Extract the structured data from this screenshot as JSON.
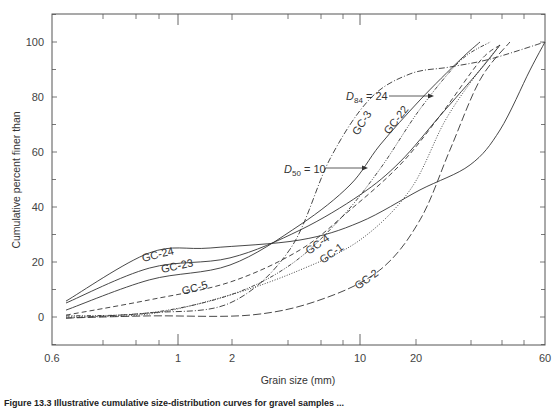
{
  "chart_data": {
    "type": "line",
    "title": "",
    "xlabel": "Grain size (mm)",
    "ylabel": "Cumulative percent finer than",
    "xscale": "log",
    "xlim": [
      0.6,
      60
    ],
    "ylim": [
      -10,
      110
    ],
    "grid": false,
    "legend": "inline curve labels",
    "x_tick_labels": [
      "0.6",
      "1",
      "2",
      "10",
      "20",
      "60"
    ],
    "y_tick_labels": [
      "0",
      "20",
      "40",
      "60",
      "80",
      "100"
    ],
    "series": [
      {
        "name": "GC-24",
        "style": "solid",
        "x": [
          0.635,
          0.89,
          1.51,
          4.7,
          10,
          20.7,
          31.7,
          40.9,
          52.8,
          60
        ],
        "y": [
          5.8,
          23.3,
          25.1,
          28.0,
          34.5,
          46.2,
          55.3,
          68.0,
          89.8,
          100
        ]
      },
      {
        "name": "GC-23",
        "style": "solid",
        "x": [
          0.635,
          0.89,
          1.95,
          4.7,
          10,
          16.4,
          24.5,
          34.5,
          40.9
        ],
        "y": [
          5.1,
          17.8,
          21.5,
          31.6,
          44.4,
          56.4,
          73.1,
          89.8,
          98.9
        ]
      },
      {
        "name": "GC-22",
        "style": "solid",
        "x": [
          0.635,
          0.89,
          1.95,
          4.7,
          8.82,
          12.8,
          20.7,
          29.1,
          34.5
        ],
        "y": [
          2.5,
          13.5,
          18.9,
          33.5,
          48.0,
          62.5,
          78.9,
          93.5,
          100
        ]
      },
      {
        "name": "GC-3",
        "style": "dash-dot",
        "x": [
          0.635,
          0.89,
          1.95,
          4.15,
          6.86,
          11.3,
          18.6,
          26.7,
          37.6,
          60
        ],
        "y": [
          -0.4,
          1.5,
          5.1,
          24.7,
          57.5,
          79.3,
          88.4,
          90.9,
          93.8,
          100
        ]
      },
      {
        "name": "GC-5",
        "style": "dashed",
        "x": [
          0.635,
          0.89,
          1.95,
          4.7,
          8.82,
          16.4,
          24.5,
          34.5,
          40.9
        ],
        "y": [
          0.7,
          6.2,
          12.7,
          24.4,
          38.9,
          55.3,
          73.1,
          93.1,
          98.9
        ]
      },
      {
        "name": "GC-4",
        "style": "dash-dot-dot",
        "x": [
          0.635,
          0.89,
          1.95,
          4.15,
          7.78,
          12.8,
          20.7,
          29.1,
          37.6
        ],
        "y": [
          0.4,
          1.5,
          8.0,
          18.9,
          35.6,
          53.8,
          75.6,
          93.1,
          100
        ]
      },
      {
        "name": "GC-1",
        "style": "dotted",
        "x": [
          0.635,
          0.89,
          1.95,
          4.7,
          10,
          18.6,
          25.6,
          33.1,
          40.9
        ],
        "y": [
          0,
          1.1,
          8.0,
          17.1,
          28.0,
          46.2,
          71.3,
          87.6,
          98.9
        ]
      },
      {
        "name": "GC-2",
        "style": "long-dash",
        "x": [
          0.635,
          0.89,
          2.51,
          6.05,
          12.8,
          20.7,
          26.7,
          34.5,
          44.5
        ],
        "y": [
          -0.4,
          0.4,
          0.7,
          6.2,
          17.1,
          35.3,
          60.7,
          86.2,
          100
        ]
      }
    ],
    "annotations": [
      {
        "text_main": "D",
        "text_sub": "84",
        "text_rest": " = 24",
        "arrow_to_x": 24,
        "arrow_to_y": 80
      },
      {
        "text_main": "D",
        "text_sub": "50",
        "text_rest": " = 10",
        "arrow_to_x": 10,
        "arrow_to_y": 54
      }
    ]
  },
  "caption": "Figure 13.3  Illustrative cumulative size-distribution curves for gravel samples ...",
  "colors": {
    "axis": "#555555",
    "line": "#333333",
    "background": "#ffffff"
  }
}
